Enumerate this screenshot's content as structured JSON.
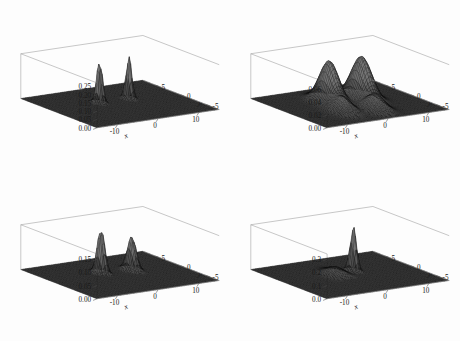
{
  "figure": {
    "title": "",
    "layout": "2x2 grid of 3D perspective mesh surface plots",
    "background_color": "#fdfdfd",
    "surface_color": "#3a3a3a",
    "mesh_color": "#101010",
    "box_color": "#9a9a9a"
  },
  "chart_data": [
    {
      "type": "surface",
      "panel": "top-left",
      "title": "",
      "xlabel": "x",
      "ylabel": "y",
      "zlabel": "",
      "xlim": [
        -15,
        15
      ],
      "ylim": [
        -7.5,
        7.5
      ],
      "zlim": [
        0,
        0.27
      ],
      "xticks": [
        -10,
        0,
        10
      ],
      "xticklabels": [
        "-10",
        "0",
        "10"
      ],
      "yticks": [
        5,
        0,
        -5
      ],
      "yticklabels": [
        "5",
        "0",
        "-5"
      ],
      "zticks": [
        0.0,
        0.05,
        0.1,
        0.15,
        0.2,
        0.25
      ],
      "zticklabels": [
        "0.00",
        "0.05",
        "0.10",
        "0.15",
        "0.20",
        "0.25"
      ],
      "grid": false,
      "legend": "none",
      "features": [
        {
          "kind": "peak",
          "x": -3.0,
          "y": 1.6,
          "z": 0.262,
          "width": 0.45,
          "note": "tall narrow spike"
        },
        {
          "kind": "peak",
          "x": 4.2,
          "y": 1.6,
          "z": 0.255,
          "width": 0.45,
          "note": "tall narrow spike"
        },
        {
          "kind": "dip",
          "x": -6.0,
          "y": -1.0,
          "z": -0.055,
          "width": 1.1,
          "note": "trough"
        },
        {
          "kind": "dip",
          "x": 1.5,
          "y": -2.6,
          "z": -0.05,
          "width": 1.1,
          "note": "trough"
        }
      ]
    },
    {
      "type": "surface",
      "panel": "top-right",
      "title": "",
      "xlabel": "x",
      "ylabel": "y",
      "zlabel": "",
      "xlim": [
        -15,
        15
      ],
      "ylim": [
        -7.5,
        7.5
      ],
      "zlim": [
        0,
        0.07
      ],
      "xticks": [
        -10,
        0,
        10
      ],
      "xticklabels": [
        "-10",
        "0",
        "10"
      ],
      "yticks": [
        5,
        0,
        -5
      ],
      "yticklabels": [
        "5",
        "0",
        "-5"
      ],
      "zticks": [
        0.0,
        0.02,
        0.04,
        0.06
      ],
      "zticklabels": [
        "0.00",
        "0.02",
        "0.04",
        "0.06"
      ],
      "grid": false,
      "legend": "none",
      "features": [
        {
          "kind": "peak",
          "x": -2.6,
          "y": 2.0,
          "z": 0.064,
          "width": 1.5,
          "note": "broad cone"
        },
        {
          "kind": "peak",
          "x": 4.6,
          "y": 1.4,
          "z": 0.066,
          "width": 1.6,
          "note": "broad cone"
        },
        {
          "kind": "peak",
          "x": -4.5,
          "y": -2.2,
          "z": 0.022,
          "width": 1.5,
          "note": "small cone"
        },
        {
          "kind": "peak",
          "x": 2.0,
          "y": -3.4,
          "z": 0.024,
          "width": 1.5,
          "note": "small cone"
        }
      ]
    },
    {
      "type": "surface",
      "panel": "bottom-left",
      "title": "",
      "xlabel": "x",
      "ylabel": "y",
      "zlabel": "",
      "xlim": [
        -15,
        15
      ],
      "ylim": [
        -7.5,
        7.5
      ],
      "zlim": [
        0,
        0.17
      ],
      "xticks": [
        -10,
        0,
        10
      ],
      "xticklabels": [
        "-10",
        "0",
        "10"
      ],
      "yticks": [
        5,
        0,
        -5
      ],
      "yticklabels": [
        "5",
        "0",
        "-5"
      ],
      "zticks": [
        0.0,
        0.05,
        0.1,
        0.15
      ],
      "zticklabels": [
        "0.00",
        "0.05",
        "0.10",
        "0.15"
      ],
      "grid": false,
      "legend": "none",
      "features": [
        {
          "kind": "peak",
          "x": -2.4,
          "y": 1.8,
          "z": 0.168,
          "width": 0.6,
          "note": "tall spike"
        },
        {
          "kind": "peak",
          "x": 4.4,
          "y": 1.2,
          "z": 0.128,
          "width": 0.7,
          "note": "spike"
        },
        {
          "kind": "dip",
          "x": -5.2,
          "y": -0.6,
          "z": -0.042,
          "width": 1.2,
          "note": "trough"
        },
        {
          "kind": "dip",
          "x": 1.8,
          "y": -2.4,
          "z": -0.04,
          "width": 1.2,
          "note": "trough"
        }
      ]
    },
    {
      "type": "surface",
      "panel": "bottom-right",
      "title": "",
      "xlabel": "x",
      "ylabel": "y",
      "zlabel": "",
      "xlim": [
        -15,
        15
      ],
      "ylim": [
        -7.5,
        7.5
      ],
      "zlim": [
        0,
        0.34
      ],
      "xticks": [
        -10,
        0,
        10
      ],
      "xticklabels": [
        "-10",
        "0",
        "10"
      ],
      "yticks": [
        5,
        0,
        -5
      ],
      "yticklabels": [
        "5",
        "0",
        "-5"
      ],
      "zticks": [
        0.0,
        0.1,
        0.2,
        0.3
      ],
      "zticklabels": [
        "0.0",
        "0.1",
        "0.2",
        "0.3"
      ],
      "grid": false,
      "legend": "none",
      "features": [
        {
          "kind": "peak",
          "x": 2.6,
          "y": 1.4,
          "z": 0.335,
          "width": 0.5,
          "note": "single tall narrow spike"
        },
        {
          "kind": "bump",
          "x": -2.2,
          "y": 1.0,
          "z": 0.055,
          "width": 1.4,
          "note": "low broad bump"
        },
        {
          "kind": "dip",
          "x": -2.0,
          "y": -3.0,
          "z": -0.045,
          "width": 1.0,
          "note": "trough"
        }
      ]
    }
  ],
  "panels": [
    {
      "id": "panel-top-left",
      "position": "top-left",
      "zticklabels": [
        "0.25",
        "0.20",
        "0.15",
        "0.10",
        "0.05",
        "0.00"
      ],
      "xticklabels": [
        "-10",
        "0",
        "10"
      ],
      "yticklabels": [
        "5",
        "0",
        "-5"
      ],
      "xlabel": "x",
      "ylabel": "y"
    },
    {
      "id": "panel-top-right",
      "position": "top-right",
      "zticklabels": [
        "0.06",
        "0.04",
        "0.02",
        "0.00"
      ],
      "xticklabels": [
        "-10",
        "0",
        "10"
      ],
      "yticklabels": [
        "5",
        "0",
        "-5"
      ],
      "xlabel": "x",
      "ylabel": "y"
    },
    {
      "id": "panel-bottom-left",
      "position": "bottom-left",
      "zticklabels": [
        "0.15",
        "0.10",
        "0.05",
        "0.00"
      ],
      "xticklabels": [
        "-10",
        "0",
        "10"
      ],
      "yticklabels": [
        "5",
        "0",
        "-5"
      ],
      "xlabel": "x",
      "ylabel": "y"
    },
    {
      "id": "panel-bottom-right",
      "position": "bottom-right",
      "zticklabels": [
        "0.3",
        "0.2",
        "0.1",
        "0.0"
      ],
      "xticklabels": [
        "-10",
        "0",
        "10"
      ],
      "yticklabels": [
        "5",
        "0",
        "-5"
      ],
      "xlabel": "x",
      "ylabel": "y"
    }
  ]
}
